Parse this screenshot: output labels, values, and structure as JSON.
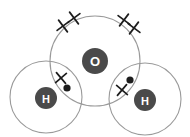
{
  "diagram": {
    "molecule_formula": "H2O",
    "background_color": "#ffffff",
    "shell_stroke_color": "#9a9a9a",
    "nucleus_fill_color": "#4a4a4a",
    "nucleus_text_color": "#ffffff",
    "electron_color": "#1d1d1d",
    "atoms": [
      {
        "id": "oxygen",
        "label": "O",
        "element": "Oxygen",
        "shell": {
          "cx": 95,
          "cy": 61,
          "r": 45
        },
        "nucleus": {
          "cx": 95,
          "cy": 61,
          "r": 13
        }
      },
      {
        "id": "hydrogen-left",
        "label": "H",
        "element": "Hydrogen",
        "shell": {
          "cx": 46,
          "cy": 97,
          "r": 36
        },
        "nucleus": {
          "cx": 46,
          "cy": 98,
          "r": 11
        }
      },
      {
        "id": "hydrogen-right",
        "label": "H",
        "element": "Hydrogen",
        "shell": {
          "cx": 145,
          "cy": 99,
          "r": 36
        },
        "nucleus": {
          "cx": 145,
          "cy": 100,
          "r": 11
        }
      }
    ],
    "electrons": {
      "lone_pair_crosses": [
        {
          "name": "oxygen-lone-cross-1",
          "cx": 63,
          "cy": 26,
          "size": 5.2,
          "rot": 8
        },
        {
          "name": "oxygen-lone-cross-2",
          "cx": 74,
          "cy": 18,
          "size": 5.2,
          "rot": 8
        },
        {
          "name": "oxygen-lone-cross-3",
          "cx": 124,
          "cy": 20,
          "size": 5.2,
          "rot": -8
        },
        {
          "name": "oxygen-lone-cross-4",
          "cx": 134,
          "cy": 28,
          "size": 5.2,
          "rot": -8
        }
      ],
      "bond_pair_left": [
        {
          "name": "bond-left-cross",
          "type": "cross",
          "cx": 61,
          "cy": 78,
          "size": 5.0,
          "rot": 5
        },
        {
          "name": "bond-left-dot",
          "type": "dot",
          "cx": 67,
          "cy": 88,
          "r": 3.6
        }
      ],
      "bond_pair_right": [
        {
          "name": "bond-right-dot",
          "type": "dot",
          "cx": 130,
          "cy": 80,
          "r": 3.6
        },
        {
          "name": "bond-right-cross",
          "type": "cross",
          "cx": 122,
          "cy": 90,
          "size": 5.0,
          "rot": -5
        }
      ]
    }
  }
}
